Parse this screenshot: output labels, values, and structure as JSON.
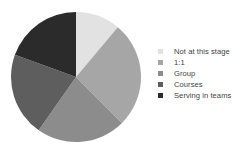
{
  "chart_data": {
    "type": "pie",
    "title": "",
    "categories": [
      "Not at this stage",
      "1:1",
      "Group",
      "Courses",
      "Serving in teams"
    ],
    "values": [
      11,
      26,
      22,
      21,
      20
    ],
    "units": "percent",
    "start_angle_deg": 0,
    "direction": "clockwise",
    "segments": [
      {
        "label": "Not at this stage",
        "value": 11,
        "color": "#e2e2e2",
        "start_deg": 0,
        "end_deg": 40
      },
      {
        "label": "1:1",
        "value": 26,
        "color": "#a6a6a6",
        "start_deg": 40,
        "end_deg": 135
      },
      {
        "label": "Group",
        "value": 22,
        "color": "#8c8c8c",
        "start_deg": 135,
        "end_deg": 215
      },
      {
        "label": "Courses",
        "value": 21,
        "color": "#5e5e5e",
        "start_deg": 215,
        "end_deg": 290
      },
      {
        "label": "Serving in teams",
        "value": 20,
        "color": "#2b2b2b",
        "start_deg": 290,
        "end_deg": 360
      }
    ],
    "legend": {
      "position": "right",
      "entries": [
        {
          "label": "Not at this stage",
          "color": "#e2e2e2"
        },
        {
          "label": "1:1",
          "color": "#a6a6a6"
        },
        {
          "label": "Group",
          "color": "#8c8c8c"
        },
        {
          "label": "Courses",
          "color": "#5e5e5e"
        },
        {
          "label": "Serving in teams",
          "color": "#2b2b2b"
        }
      ]
    },
    "geometry": {
      "cx": 76,
      "cy": 77,
      "r": 65
    },
    "background": "#ffffff",
    "grid": false,
    "data_labels": false
  }
}
